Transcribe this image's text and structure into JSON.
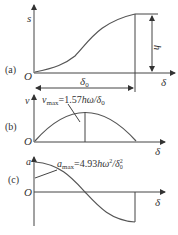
{
  "panels": {
    "a": {
      "label": "(a)",
      "y_axis": "s",
      "x_axis": "δ",
      "origin": "O",
      "dim_h": "h",
      "dim_delta0": "δ0"
    },
    "b": {
      "label": "(b)",
      "y_axis": "v",
      "x_axis": "δ",
      "origin": "O",
      "annotation": "vmax=1.57hω/δ0",
      "annotation_parts": {
        "var": "v",
        "sub": "max",
        "eq": "=1.57",
        "expr": "hω/δ",
        "sub2": "0"
      }
    },
    "c": {
      "label": "(c)",
      "y_axis": "a",
      "x_axis": "δ",
      "origin": "O",
      "annotation": "amax=4.93hω²/δ0²",
      "annotation_parts": {
        "var": "a",
        "sub": "max",
        "eq": "=4.93",
        "expr": "hω",
        "sup": "2",
        "slash": "/δ",
        "sub2": "0",
        "sup2": "2"
      }
    }
  }
}
